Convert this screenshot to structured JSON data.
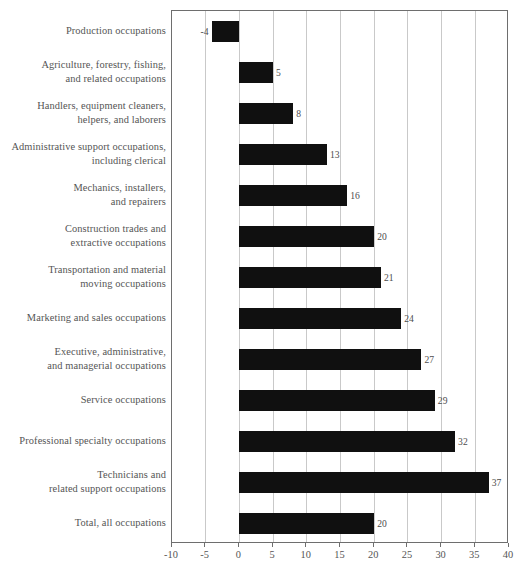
{
  "chart_data": {
    "type": "bar",
    "orientation": "horizontal",
    "title": "",
    "xlabel": "",
    "ylabel": "",
    "xlim": [
      -10,
      40
    ],
    "xticks": [
      -10,
      -5,
      0,
      5,
      10,
      15,
      20,
      25,
      30,
      35,
      40
    ],
    "xtick_labels": [
      "-10",
      "-5",
      "0",
      "5",
      "10",
      "15",
      "20",
      "25",
      "30",
      "35",
      "40"
    ],
    "grid": true,
    "grid_axis": "x",
    "legend": false,
    "categories": [
      "Production occupations",
      "Agriculture, forestry, fishing,\nand related occupations",
      "Handlers, equipment cleaners,\nhelpers, and laborers",
      "Administrative support occupations,\nincluding clerical",
      "Mechanics, installers,\nand repairers",
      "Construction trades and\nextractive occupations",
      "Transportation and material\nmoving occupations",
      "Marketing and sales occupations",
      "Executive, administrative,\nand managerial occupations",
      "Service occupations",
      "Professional specialty occupations",
      "Technicians and\nrelated support occupations",
      "Total, all occupations"
    ],
    "values": [
      -4,
      5,
      8,
      13,
      16,
      20,
      21,
      24,
      27,
      29,
      32,
      37,
      20
    ],
    "value_labels": [
      "-4",
      "5",
      "8",
      "13",
      "16",
      "20",
      "21",
      "24",
      "27",
      "29",
      "32",
      "37",
      "20"
    ],
    "bar_color": "#101010",
    "grid_color": "#c9c9c9",
    "axis_color": "#6e6e6e",
    "text_color": "#555555"
  }
}
